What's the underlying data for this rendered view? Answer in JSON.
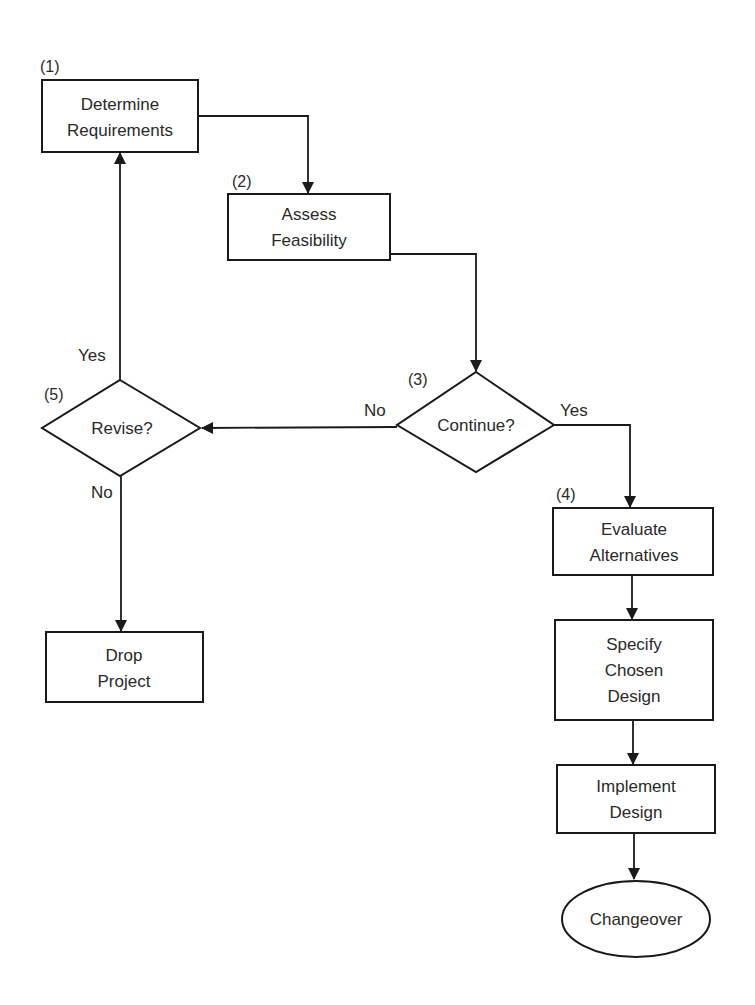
{
  "diagram": {
    "type": "flowchart",
    "nodes": {
      "determine": {
        "step": "(1)",
        "lines": [
          "Determine",
          "Requirements"
        ],
        "shape": "rectangle"
      },
      "assess": {
        "step": "(2)",
        "lines": [
          "Assess",
          "Feasibility"
        ],
        "shape": "rectangle"
      },
      "continue": {
        "step": "(3)",
        "lines": [
          "Continue?"
        ],
        "shape": "diamond"
      },
      "evaluate": {
        "step": "(4)",
        "lines": [
          "Evaluate",
          "Alternatives"
        ],
        "shape": "rectangle"
      },
      "revise": {
        "step": "(5)",
        "lines": [
          "Revise?"
        ],
        "shape": "diamond"
      },
      "drop": {
        "lines": [
          "Drop",
          "Project"
        ],
        "shape": "rectangle"
      },
      "specify": {
        "lines": [
          "Specify",
          "Chosen",
          "Design"
        ],
        "shape": "rectangle"
      },
      "implement": {
        "lines": [
          "Implement",
          "Design"
        ],
        "shape": "rectangle"
      },
      "changeover": {
        "lines": [
          "Changeover"
        ],
        "shape": "ellipse"
      }
    },
    "edges": [
      {
        "from": "determine",
        "to": "assess",
        "label": ""
      },
      {
        "from": "assess",
        "to": "continue",
        "label": ""
      },
      {
        "from": "continue",
        "to": "revise",
        "label": "No"
      },
      {
        "from": "continue",
        "to": "evaluate",
        "label": "Yes"
      },
      {
        "from": "revise",
        "to": "determine",
        "label": "Yes"
      },
      {
        "from": "revise",
        "to": "drop",
        "label": "No"
      },
      {
        "from": "evaluate",
        "to": "specify",
        "label": ""
      },
      {
        "from": "specify",
        "to": "implement",
        "label": ""
      },
      {
        "from": "implement",
        "to": "changeover",
        "label": ""
      }
    ]
  }
}
